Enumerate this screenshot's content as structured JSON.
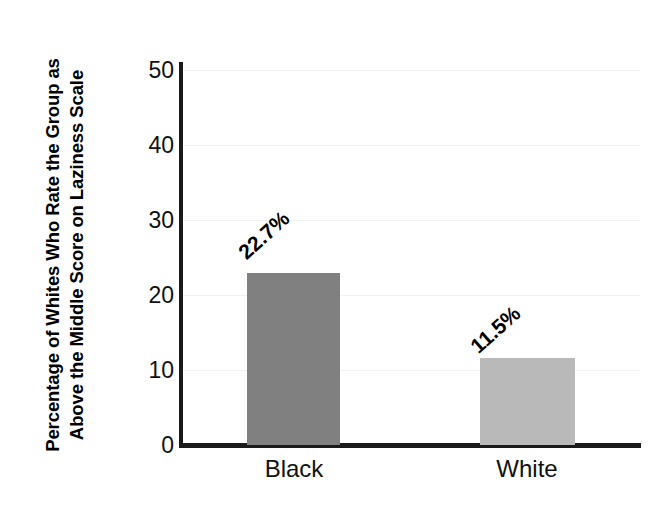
{
  "chart_data": {
    "type": "bar",
    "title": "",
    "subtitle": "",
    "xlabel": "",
    "ylabel": "Percentage of Whites Who Rate the Group as Above the Middle Score on Laziness Scale",
    "categories": [
      "Black",
      "White"
    ],
    "values": [
      22.7,
      11.5
    ],
    "value_labels": [
      "22.7%",
      "11.5%"
    ],
    "bar_colors": [
      "#808080",
      "#b9b9b9"
    ],
    "ylim": [
      0,
      50
    ],
    "yticks": [
      0,
      10,
      20,
      30,
      40,
      50
    ],
    "ytick_labels": [
      "0",
      "10",
      "20",
      "30",
      "40",
      "50"
    ],
    "grid": true,
    "legend": false,
    "legend_position": "none",
    "annotations": []
  },
  "axis": {
    "y_title": "Percentage of Whites Who Rate the Group as Above the Middle Score on Laziness Scale",
    "ticks": [
      "50",
      "40",
      "30",
      "20",
      "10",
      "0"
    ]
  },
  "bars": [
    {
      "category": "Black",
      "value": 22.7,
      "label": "22.7%",
      "color": "#808080"
    },
    {
      "category": "White",
      "value": 11.5,
      "label": "11.5%",
      "color": "#b9b9b9"
    }
  ],
  "colors": {
    "background": "#ffffff",
    "axis": "#1a1a1a",
    "grid": "#f1f1f1",
    "text": "#000000",
    "bar_dark": "#808080",
    "bar_light": "#b9b9b9"
  }
}
